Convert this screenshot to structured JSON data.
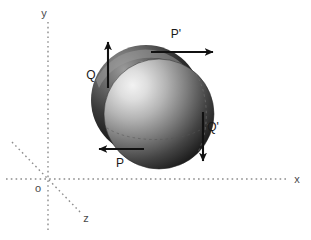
{
  "figure": {
    "background_color": "#ffffff",
    "width": 311,
    "height": 240
  },
  "axes": {
    "origin_label": "o",
    "origin": {
      "x": 48,
      "y": 179
    },
    "color": "#8c8c8c",
    "style": "dotted",
    "items": [
      {
        "name": "y-axis",
        "label": "y",
        "label_pos": {
          "x": 44,
          "y": 17
        },
        "from": {
          "x": 48,
          "y": 22
        },
        "to": {
          "x": 48,
          "y": 232
        }
      },
      {
        "name": "x-axis",
        "label": "x",
        "label_pos": {
          "x": 297,
          "y": 183
        },
        "from": {
          "x": 6,
          "y": 179
        },
        "to": {
          "x": 288,
          "y": 179
        }
      },
      {
        "name": "z-axis",
        "label": "z",
        "label_pos": {
          "x": 86,
          "y": 222
        },
        "from": {
          "x": 12,
          "y": 142
        },
        "to": {
          "x": 82,
          "y": 214
        }
      }
    ]
  },
  "spheres": [
    {
      "name": "rear-sphere",
      "description": "dark shaded sphere behind",
      "cx": 146,
      "cy": 100,
      "r": 55,
      "fill_light": "#6e6e6e",
      "fill_dark": "#111111"
    },
    {
      "name": "front-sphere",
      "description": "light shaded sphere in front",
      "cx": 159,
      "cy": 114,
      "r": 55,
      "fill_light": "#e8e8e8",
      "fill_dark": "#151515"
    }
  ],
  "forces": [
    {
      "name": "force-p-prime",
      "label": "P'",
      "label_pos": {
        "x": 176,
        "y": 38
      },
      "from": {
        "x": 151,
        "y": 52
      },
      "to": {
        "x": 213,
        "y": 52
      },
      "direction": "right",
      "color": "#111111"
    },
    {
      "name": "force-p",
      "label": "P",
      "label_pos": {
        "x": 118,
        "y": 166
      },
      "from": {
        "x": 144,
        "y": 149
      },
      "to": {
        "x": 99,
        "y": 149
      },
      "direction": "left",
      "color": "#111111"
    },
    {
      "name": "force-q",
      "label": "Q",
      "label_pos": {
        "x": 91,
        "y": 76
      },
      "from": {
        "x": 108,
        "y": 86
      },
      "to": {
        "x": 108,
        "y": 42
      },
      "direction": "up",
      "color": "#111111"
    },
    {
      "name": "force-q-prime",
      "label": "Q'",
      "label_pos": {
        "x": 211,
        "y": 130
      },
      "from": {
        "x": 203,
        "y": 112
      },
      "to": {
        "x": 203,
        "y": 161
      },
      "direction": "down",
      "color": "#111111"
    }
  ]
}
